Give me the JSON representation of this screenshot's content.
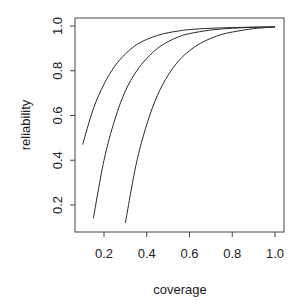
{
  "chart_data": {
    "type": "line",
    "title": "",
    "xlabel": "coverage",
    "ylabel": "reliability",
    "xlim": [
      0.06,
      1.04
    ],
    "ylim": [
      0.08,
      1.04
    ],
    "xticks": [
      0.2,
      0.4,
      0.6,
      0.8,
      1.0
    ],
    "xtick_labels": [
      "0.2",
      "0.4",
      "0.6",
      "0.8",
      "1.0"
    ],
    "yticks": [
      0.2,
      0.4,
      0.6,
      0.8,
      1.0
    ],
    "ytick_labels": [
      "0.2",
      "0.4",
      "0.6",
      "0.8",
      "1.0"
    ],
    "grid": false,
    "legend": null,
    "series": [
      {
        "name": "curve-1",
        "x": [
          0.1,
          0.15,
          0.2,
          0.25,
          0.3,
          0.35,
          0.4,
          0.45,
          0.5,
          0.55,
          0.6,
          0.7,
          0.8,
          0.9,
          1.0
        ],
        "y": [
          0.47,
          0.63,
          0.74,
          0.82,
          0.875,
          0.915,
          0.94,
          0.958,
          0.97,
          0.978,
          0.984,
          0.99,
          0.993,
          0.995,
          0.996
        ]
      },
      {
        "name": "curve-2",
        "x": [
          0.15,
          0.2,
          0.25,
          0.3,
          0.35,
          0.4,
          0.45,
          0.5,
          0.55,
          0.6,
          0.7,
          0.8,
          0.9,
          1.0
        ],
        "y": [
          0.14,
          0.4,
          0.58,
          0.71,
          0.795,
          0.855,
          0.9,
          0.93,
          0.952,
          0.966,
          0.982,
          0.99,
          0.994,
          0.996
        ]
      },
      {
        "name": "curve-3",
        "x": [
          0.3,
          0.35,
          0.4,
          0.45,
          0.5,
          0.55,
          0.6,
          0.65,
          0.7,
          0.75,
          0.8,
          0.9,
          1.0
        ],
        "y": [
          0.12,
          0.38,
          0.56,
          0.69,
          0.78,
          0.845,
          0.89,
          0.922,
          0.945,
          0.962,
          0.973,
          0.988,
          0.996
        ]
      }
    ],
    "colors": {
      "line": "#2a2a2a",
      "axis": "#444444",
      "background": "#ffffff"
    }
  }
}
